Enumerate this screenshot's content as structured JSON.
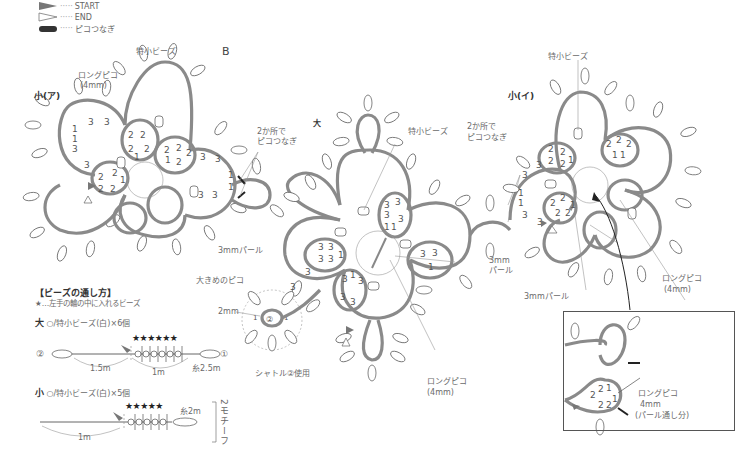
{
  "legend": {
    "start_label": "START",
    "end_label": "END",
    "picot_join_label": "ピコつなぎ"
  },
  "section_letter": "B",
  "motifs": {
    "small_a": "小(ア)",
    "large": "大",
    "small_i": "小(イ)"
  },
  "annotations": {
    "long_picot_4mm_a": "ロングピコ",
    "long_picot_4mm_a_size": "(4mm)",
    "extra_small_bead_a": "特小ビーズ",
    "join_two_places_a_1": "2か所で",
    "join_two_places_a_2": "ピコつなぎ",
    "pearl_3mm_a": "3mmパール",
    "large_picot": "大きめのピコ",
    "size_2mm": "2mm",
    "shuttle2_used": "シャトル②使用",
    "extra_small_bead_center": "特小ビーズ",
    "pearl_3mm_center_1": "3mm",
    "pearl_3mm_center_2": "パール",
    "long_picot_center": "ロングピコ",
    "long_picot_center_size": "(4mm)",
    "extra_small_bead_i": "特小ビーズ",
    "join_two_places_i_1": "2か所で",
    "join_two_places_i_2": "ピコつなぎ",
    "pearl_3mm_i_1": "3mm",
    "pearl_3mm_i_2": "パール",
    "pearl_3mm_i_b": "3mmパール",
    "long_picot_i": "ロングピコ",
    "long_picot_i_size": "(4mm)"
  },
  "inset": {
    "long_picot": "ロングピコ",
    "size": "4mm",
    "note": "(パール通し分)"
  },
  "bead_guide": {
    "title": "【ビーズの通し方】",
    "star_note": "★…左手の輪の中に入れるビーズ",
    "large": {
      "label": "大",
      "desc": "○/特小ビーズ(白)×6個",
      "stars": "★★★★★★",
      "shuttle_left": "②",
      "shuttle_right": "①",
      "len_left": "1.5m",
      "len_mid": "1m",
      "thread": "糸2.5m"
    },
    "small": {
      "label": "小",
      "desc": "○/特小ビーズ(白)×5個",
      "stars": "★★★★★",
      "len_left": "1m",
      "thread": "糸2m",
      "motif_count": "2モチーフ"
    }
  },
  "colors": {
    "thread": "#8a8a8a",
    "text": "#666666",
    "outline": "#555555"
  }
}
